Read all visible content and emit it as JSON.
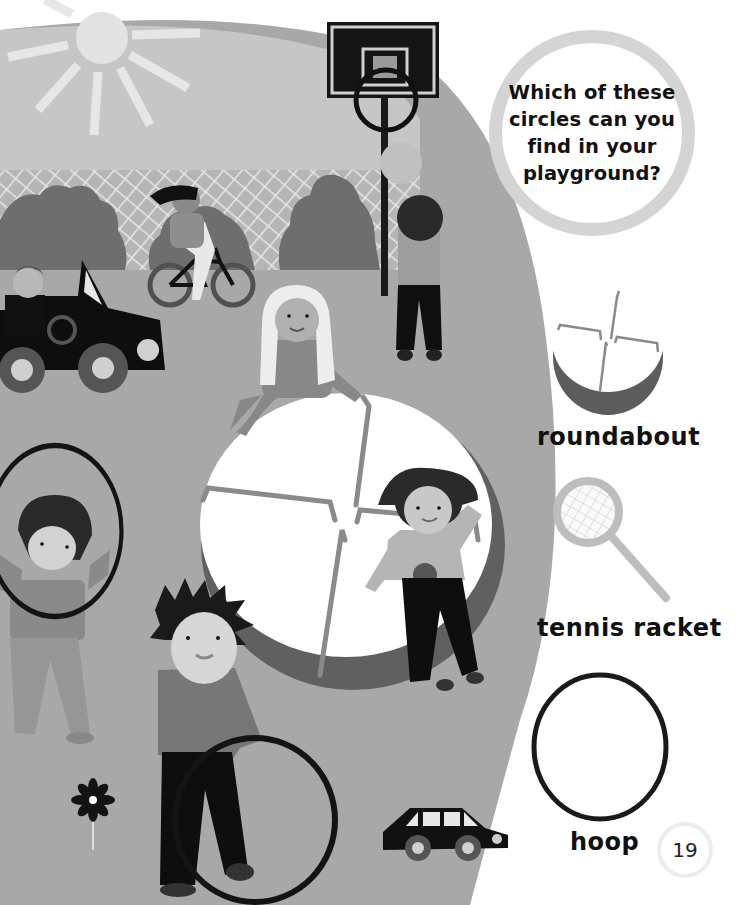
{
  "page": {
    "question": "Which of these circles can you find in your playground?",
    "page_number": "19"
  },
  "circle_examples": [
    {
      "label": "roundabout",
      "icon": "roundabout-icon"
    },
    {
      "label": "tennis racket",
      "icon": "tennis-racket-icon"
    },
    {
      "label": "hoop",
      "icon": "hoop-icon"
    }
  ],
  "illustration": {
    "scene": "playground",
    "elements": [
      "sun",
      "fence",
      "bushes",
      "basketball-hoop",
      "ball",
      "girl-on-bicycle",
      "boy-in-toy-car",
      "roundabout",
      "child-with-hoop",
      "boy-rolling-hoop",
      "flower",
      "toy-car"
    ]
  },
  "colors": {
    "ground": "#a7a7a7",
    "sky": "#c6c6c6",
    "bushes": "#6f6f6f",
    "dark": "#141414",
    "bubble_ring": "#d4d4d4"
  }
}
